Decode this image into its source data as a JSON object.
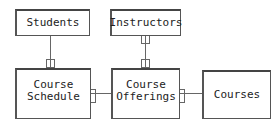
{
  "diagram": {
    "type": "entity-relationship",
    "entities": [
      {
        "id": "students",
        "label": "Students"
      },
      {
        "id": "instructors",
        "label": "Instructors"
      },
      {
        "id": "course_schedule",
        "label": "Course\nSchedule"
      },
      {
        "id": "course_offerings",
        "label": "Course\nOfferings"
      },
      {
        "id": "courses",
        "label": "Courses"
      }
    ],
    "relationships": [
      {
        "from": "students",
        "to": "course_schedule"
      },
      {
        "from": "instructors",
        "to": "course_offerings"
      },
      {
        "from": "course_schedule",
        "to": "course_offerings"
      },
      {
        "from": "course_offerings",
        "to": "courses"
      }
    ],
    "colors": {
      "line": "#555555",
      "background": "#ffffff",
      "text": "#222222"
    }
  }
}
